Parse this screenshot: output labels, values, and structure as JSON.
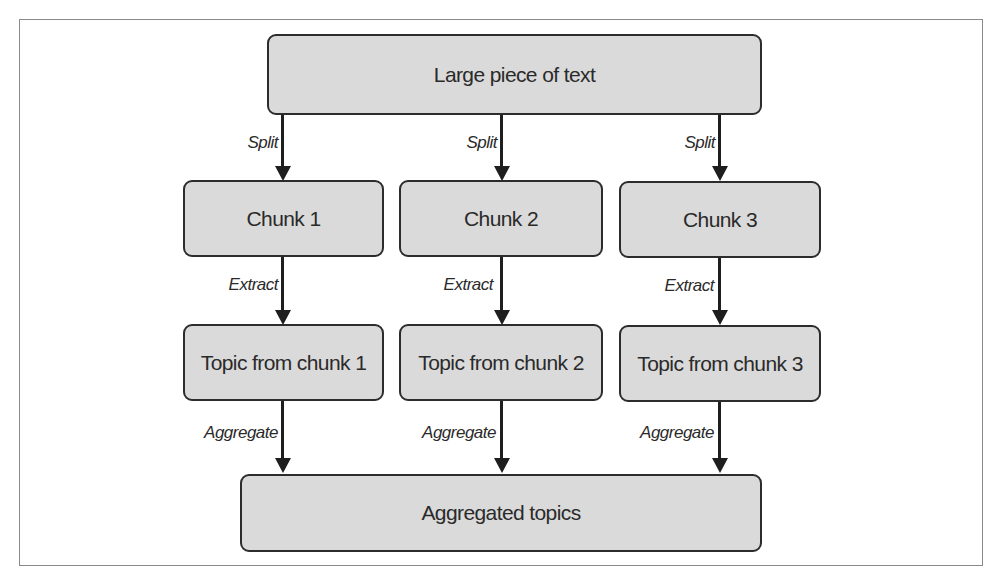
{
  "diagram": {
    "type": "flowchart",
    "root": {
      "label": "Large piece of text"
    },
    "chunks": [
      {
        "label": "Chunk 1"
      },
      {
        "label": "Chunk 2"
      },
      {
        "label": "Chunk 3"
      }
    ],
    "topics": [
      {
        "label": "Topic from chunk 1"
      },
      {
        "label": "Topic from chunk 2"
      },
      {
        "label": "Topic from chunk 3"
      }
    ],
    "sink": {
      "label": "Aggregated topics"
    },
    "edge_labels": {
      "split": "Split",
      "extract": "Extract",
      "aggregate": "Aggregate"
    },
    "colors": {
      "node_fill": "#dadada",
      "node_stroke": "#2c2c2c",
      "arrow": "#1e1e1e",
      "frame": "#8a8a8a"
    }
  }
}
